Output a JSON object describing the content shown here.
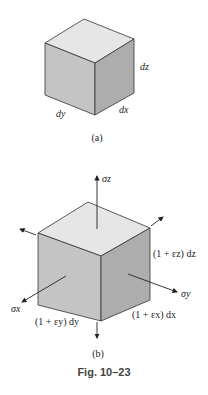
{
  "figure": {
    "caption": "Fig. 10–23",
    "part_a": {
      "label": "(a)",
      "dims": {
        "dz": "dz",
        "dy": "dy",
        "dx": "dx"
      }
    },
    "part_b": {
      "label": "(b)",
      "stresses": {
        "sz": "σz",
        "sx": "σx",
        "sy": "σy"
      },
      "dims": {
        "z": "(1 + εz) dz",
        "y": "(1 + εy) dy",
        "x": "(1 + εx) dx"
      }
    },
    "colors": {
      "top": "#e6e6e6",
      "left": "#c4c4c4",
      "right": "#adadad",
      "edge": "#333333"
    }
  }
}
